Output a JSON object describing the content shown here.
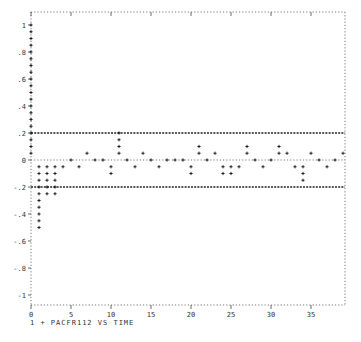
{
  "chart_data": {
    "type": "scatter",
    "title": "",
    "caption": "1 + PACFR112  VS  TIME",
    "xlabel": "TIME",
    "ylabel": "PACFR112",
    "xlim": [
      0,
      39
    ],
    "ylim": [
      -1,
      1
    ],
    "x_ticks": [
      0,
      5,
      10,
      15,
      20,
      25,
      30,
      35
    ],
    "x_tick_labels": [
      "0",
      "5",
      "10",
      "15",
      "20",
      "25",
      "30",
      "35"
    ],
    "y_ticks": [
      1,
      0.8,
      0.6,
      0.4,
      0.2,
      0,
      -0.2,
      -0.4,
      -0.6,
      -0.8,
      -1
    ],
    "y_tick_labels": [
      "1",
      ".8",
      ".6",
      ".4",
      ".2",
      "0",
      "-.2",
      "-.4",
      "-.6",
      "-.8",
      "-1"
    ],
    "marker": "+",
    "confidence_bands": [
      0.2,
      -0.2
    ],
    "grid": false,
    "legend": [
      {
        "symbol": "1",
        "series": "PACFR112"
      }
    ],
    "series": [
      {
        "name": "PACFR112",
        "x": [
          0,
          1,
          2,
          3,
          4,
          5,
          6,
          7,
          8,
          9,
          10,
          11,
          12,
          13,
          14,
          15,
          16,
          17,
          18,
          19,
          20,
          21,
          22,
          23,
          24,
          25,
          26,
          27,
          28,
          29,
          30,
          31,
          32,
          33,
          34,
          35,
          36,
          37,
          38,
          39
        ],
        "values": [
          1.0,
          -0.5,
          -0.25,
          -0.25,
          -0.05,
          0.0,
          -0.05,
          0.05,
          0.0,
          0.0,
          -0.1,
          0.2,
          0.0,
          -0.05,
          0.05,
          0.0,
          -0.05,
          0.0,
          0.0,
          0.0,
          -0.1,
          0.1,
          0.0,
          0.05,
          -0.1,
          -0.1,
          -0.05,
          0.1,
          0.0,
          -0.05,
          0.0,
          0.1,
          0.05,
          -0.05,
          -0.15,
          0.05,
          0.0,
          -0.05,
          0.0,
          0.05
        ]
      }
    ]
  }
}
